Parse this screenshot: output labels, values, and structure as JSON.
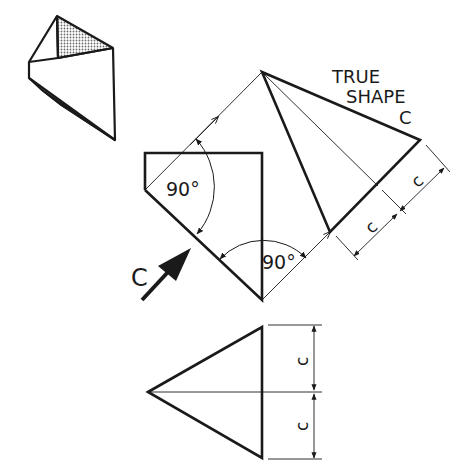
{
  "drawing": {
    "title_line1": "TRUE",
    "title_line2": "SHAPE",
    "title_line3": "C",
    "angle_label_1": "90°",
    "angle_label_2": "90°",
    "view_arrow_label": "C",
    "dimension_labels": {
      "true_shape_upper": "c",
      "true_shape_lower": "c",
      "plan_upper": "c",
      "plan_lower": "c"
    },
    "colors": {
      "line": "#1a1a1a",
      "background": "#ffffff",
      "hatch": "#8a8a8a"
    }
  }
}
